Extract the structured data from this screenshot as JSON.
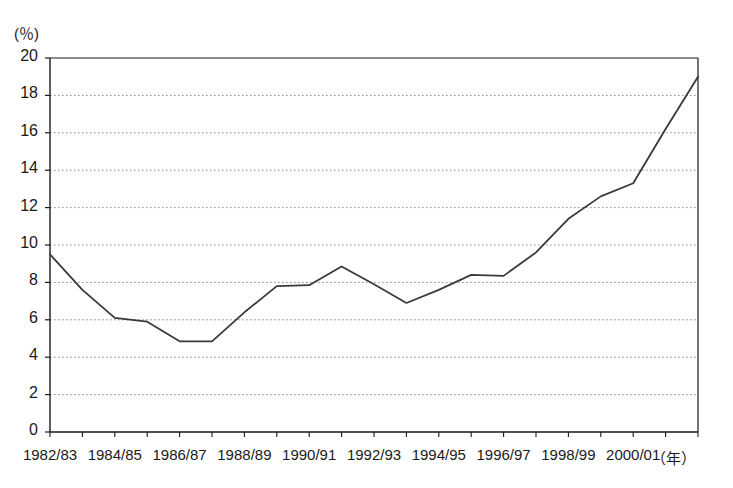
{
  "chart_data": {
    "type": "line",
    "title": "",
    "subtitle": "",
    "xlabel": "年",
    "ylabel": "(%)",
    "y_unit_label": "(％)",
    "x_unit_label": "（年）",
    "grid": true,
    "grid_style": "dotted-horizontal",
    "legend": "none",
    "line_color": "#3a3a3a",
    "axis_color": "#1a1a1a",
    "grid_color": "#8a8a8a",
    "background": "#ffffff",
    "ylim": [
      0,
      20
    ],
    "ytick_labels": [
      "0",
      "2",
      "4",
      "6",
      "8",
      "10",
      "12",
      "14",
      "16",
      "18",
      "20"
    ],
    "yticks": [
      0,
      2,
      4,
      6,
      8,
      10,
      12,
      14,
      16,
      18,
      20
    ],
    "xlim": [
      0,
      20
    ],
    "x": [
      "1982/83",
      "1983/84",
      "1984/85",
      "1985/86",
      "1986/87",
      "1987/88",
      "1988/89",
      "1989/90",
      "1990/91",
      "1991/92",
      "1992/93",
      "1993/94",
      "1994/95",
      "1995/96",
      "1996/97",
      "1997/98",
      "1998/99",
      "1999/00",
      "2000/01",
      "2001/02",
      "2002/03"
    ],
    "xtick_labels_shown": [
      "1982/83",
      "1984/85",
      "1986/87",
      "1988/89",
      "1990/91",
      "1992/93",
      "1994/95",
      "1996/97",
      "1998/99",
      "2000/01"
    ],
    "xtick_label_indices": [
      0,
      2,
      4,
      6,
      8,
      10,
      12,
      14,
      16,
      18
    ],
    "values": [
      9.5,
      7.6,
      6.1,
      5.9,
      4.85,
      4.85,
      6.4,
      7.8,
      7.85,
      8.85,
      7.9,
      6.9,
      7.6,
      8.4,
      8.35,
      9.6,
      11.4,
      12.6,
      13.3,
      16.2,
      19.0
    ]
  }
}
